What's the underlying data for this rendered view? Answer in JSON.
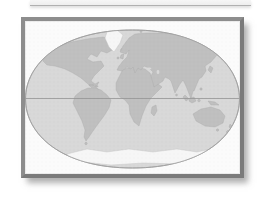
{
  "canvas": {
    "width": 267,
    "height": 198,
    "background": "#ffffff"
  },
  "theme": {
    "page_bg": "#ffffff",
    "strip_fill": "#eeeeee",
    "strip_edge": "#b0b0b0",
    "frame_border": "#7b7b7b",
    "frame_border_light": "#8d8d8d",
    "map_bg": "#fbfbfb",
    "ocean": "#d8d8d8",
    "land": "#bfbfbf",
    "ice": "#f6f6f6",
    "outline": "#9e9e9e",
    "equator": "#949494",
    "shadow": "rgba(110,110,110,0.55)"
  },
  "map": {
    "type": "world-map",
    "projection_shape": "flattened-ellipse",
    "equator_line": true,
    "regions": [
      "north-america",
      "greenland",
      "south-america",
      "africa",
      "eurasia",
      "australia",
      "antarctica",
      "madagascar",
      "british-isles",
      "iceland",
      "japan",
      "sumatra",
      "borneo",
      "new-guinea",
      "new-zealand",
      "caribbean",
      "tasmania",
      "sri-lanka",
      "philippines",
      "tierra-del-fuego",
      "svalbard",
      "caspian-sea",
      "black-sea"
    ]
  }
}
